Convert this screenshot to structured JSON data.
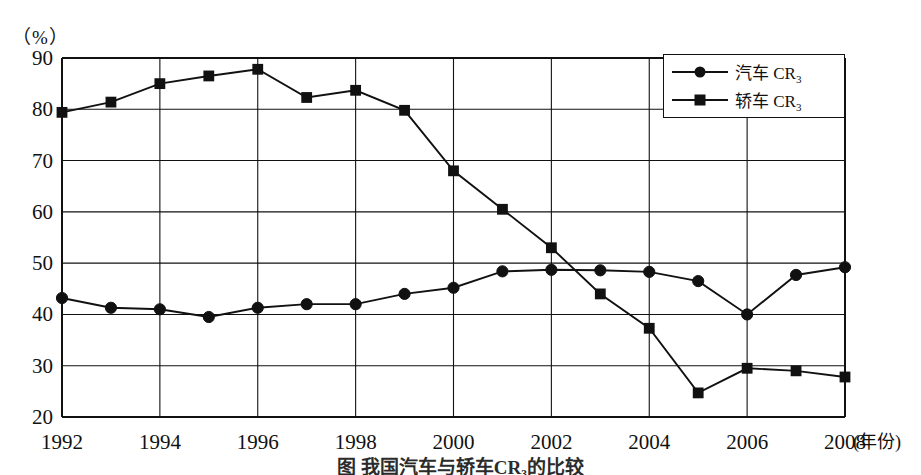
{
  "axis_unit_label": "（%）",
  "x_unit_label": "(年份)",
  "caption": "图     我国汽车与轿车CR₃的比较",
  "legend": [
    {
      "label_main": "汽车",
      "label_cr": "CR",
      "label_sub": "3",
      "marker": "circle-marker"
    },
    {
      "label_main": "轿车",
      "label_cr": "CR",
      "label_sub": "3",
      "marker": "square-marker"
    }
  ],
  "chart_data": {
    "type": "line",
    "xlabel": "年份",
    "ylabel": "%",
    "xlim": [
      1992,
      2008
    ],
    "ylim": [
      20,
      90
    ],
    "ytick_values": [
      20,
      30,
      40,
      50,
      60,
      70,
      80,
      90
    ],
    "xtick_values": [
      1992,
      1994,
      1996,
      1998,
      2000,
      2002,
      2004,
      2006,
      2008
    ],
    "xtick_labels": [
      "1992",
      "1994",
      "1996",
      "1998",
      "2000",
      "2002",
      "2004",
      "2006",
      "2008"
    ],
    "ytick_labels": [
      "20",
      "30",
      "40",
      "50",
      "60",
      "70",
      "80",
      "90"
    ],
    "grid": true,
    "legend_position": "top-right",
    "x": [
      1992,
      1993,
      1994,
      1995,
      1996,
      1997,
      1998,
      1999,
      2000,
      2001,
      2002,
      2003,
      2004,
      2005,
      2006,
      2007,
      2008
    ],
    "series": [
      {
        "name": "汽车CR3",
        "marker": "circle",
        "values": [
          43.2,
          41.3,
          41.0,
          39.5,
          41.3,
          42.0,
          42.0,
          44.0,
          45.2,
          48.4,
          48.7,
          48.6,
          48.3,
          46.5,
          40.0,
          47.7,
          49.2
        ]
      },
      {
        "name": "轿车CR3",
        "marker": "square",
        "values": [
          79.4,
          81.4,
          85.0,
          86.5,
          87.8,
          82.3,
          83.7,
          79.8,
          68.0,
          60.5,
          53.0,
          44.0,
          37.3,
          24.7,
          29.5,
          29.0,
          27.8
        ]
      }
    ]
  }
}
